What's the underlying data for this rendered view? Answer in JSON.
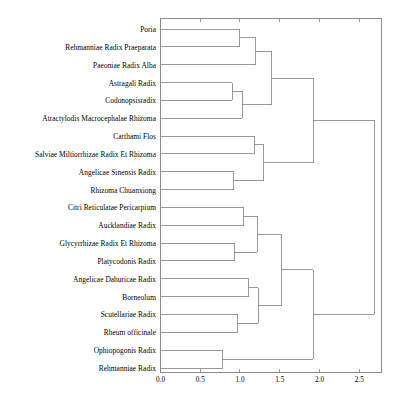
{
  "chart_data": {
    "type": "dendrogram",
    "title": "",
    "xlabel": "",
    "ylabel": "",
    "orientation": "horizontal",
    "xlim": [
      0.0,
      2.78
    ],
    "xticks": [
      0.0,
      0.5,
      1.0,
      1.5,
      2.0,
      2.5
    ],
    "xtick_labels": [
      "0.0",
      "0.5",
      "1.0",
      "1.5",
      "2.0",
      "2.5"
    ],
    "grid": false,
    "legend": null,
    "leaves": [
      "Poria",
      "Rehmanniae Radix Praeparata",
      "Paeoniae Radix Alba",
      "Astragali Radix",
      "Codonopsisradix",
      "Atractylodis Macrocephalae Rhizoma",
      "Carthami Flos",
      "Salviae Miltiorrhizae Radix Et Rhizoma",
      "Angelicae Sinensis Radix",
      "Rhizoma Chuanxiong",
      "Citri Reticulatae Pericarpium",
      "Aucklandiae Radix",
      "Glycyrrhizae Radix Et Rhizoma",
      "Platycodonis Radix",
      "Angelicae Dahuricae Radix",
      "Borneolum",
      "Scutellariae Radix",
      "Rheum officinale",
      "Ophiopogonis Radix",
      "Rehmanniae Radix"
    ],
    "merges": [
      {
        "id": "m1",
        "left": {
          "type": "leaf",
          "index": 0
        },
        "right": {
          "type": "leaf",
          "index": 1
        },
        "height": 1.0
      },
      {
        "id": "m2",
        "left": {
          "type": "node",
          "id": "m1"
        },
        "right": {
          "type": "leaf",
          "index": 2
        },
        "height": 1.2
      },
      {
        "id": "m3",
        "left": {
          "type": "leaf",
          "index": 3
        },
        "right": {
          "type": "leaf",
          "index": 4
        },
        "height": 0.9
      },
      {
        "id": "m4",
        "left": {
          "type": "node",
          "id": "m3"
        },
        "right": {
          "type": "leaf",
          "index": 5
        },
        "height": 1.03
      },
      {
        "id": "m5",
        "left": {
          "type": "node",
          "id": "m2"
        },
        "right": {
          "type": "node",
          "id": "m4"
        },
        "height": 1.4
      },
      {
        "id": "m6",
        "left": {
          "type": "leaf",
          "index": 6
        },
        "right": {
          "type": "leaf",
          "index": 7
        },
        "height": 1.18
      },
      {
        "id": "m7",
        "left": {
          "type": "leaf",
          "index": 8
        },
        "right": {
          "type": "leaf",
          "index": 9
        },
        "height": 0.92
      },
      {
        "id": "m8",
        "left": {
          "type": "node",
          "id": "m6"
        },
        "right": {
          "type": "node",
          "id": "m7"
        },
        "height": 1.3
      },
      {
        "id": "m9",
        "left": {
          "type": "node",
          "id": "m5"
        },
        "right": {
          "type": "node",
          "id": "m8"
        },
        "height": 1.92
      },
      {
        "id": "m10",
        "left": {
          "type": "leaf",
          "index": 10
        },
        "right": {
          "type": "leaf",
          "index": 11
        },
        "height": 1.05
      },
      {
        "id": "m11",
        "left": {
          "type": "leaf",
          "index": 12
        },
        "right": {
          "type": "leaf",
          "index": 13
        },
        "height": 0.93
      },
      {
        "id": "m12",
        "left": {
          "type": "node",
          "id": "m10"
        },
        "right": {
          "type": "node",
          "id": "m11"
        },
        "height": 1.22
      },
      {
        "id": "m13",
        "left": {
          "type": "leaf",
          "index": 14
        },
        "right": {
          "type": "leaf",
          "index": 15
        },
        "height": 1.11
      },
      {
        "id": "m14",
        "left": {
          "type": "leaf",
          "index": 16
        },
        "right": {
          "type": "leaf",
          "index": 17
        },
        "height": 0.97
      },
      {
        "id": "m15",
        "left": {
          "type": "node",
          "id": "m13"
        },
        "right": {
          "type": "node",
          "id": "m14"
        },
        "height": 1.23
      },
      {
        "id": "m16",
        "left": {
          "type": "node",
          "id": "m12"
        },
        "right": {
          "type": "node",
          "id": "m15"
        },
        "height": 1.52
      },
      {
        "id": "m17",
        "left": {
          "type": "leaf",
          "index": 18
        },
        "right": {
          "type": "leaf",
          "index": 19
        },
        "height": 0.78
      },
      {
        "id": "m18",
        "left": {
          "type": "node",
          "id": "m16"
        },
        "right": {
          "type": "node",
          "id": "m17"
        },
        "height": 1.92
      },
      {
        "id": "m19",
        "left": {
          "type": "node",
          "id": "m9"
        },
        "right": {
          "type": "node",
          "id": "m18"
        },
        "height": 2.69
      }
    ],
    "colors": {
      "line": "#808080",
      "axis": "#808080",
      "text": "#000000",
      "background": "#ffffff"
    }
  }
}
